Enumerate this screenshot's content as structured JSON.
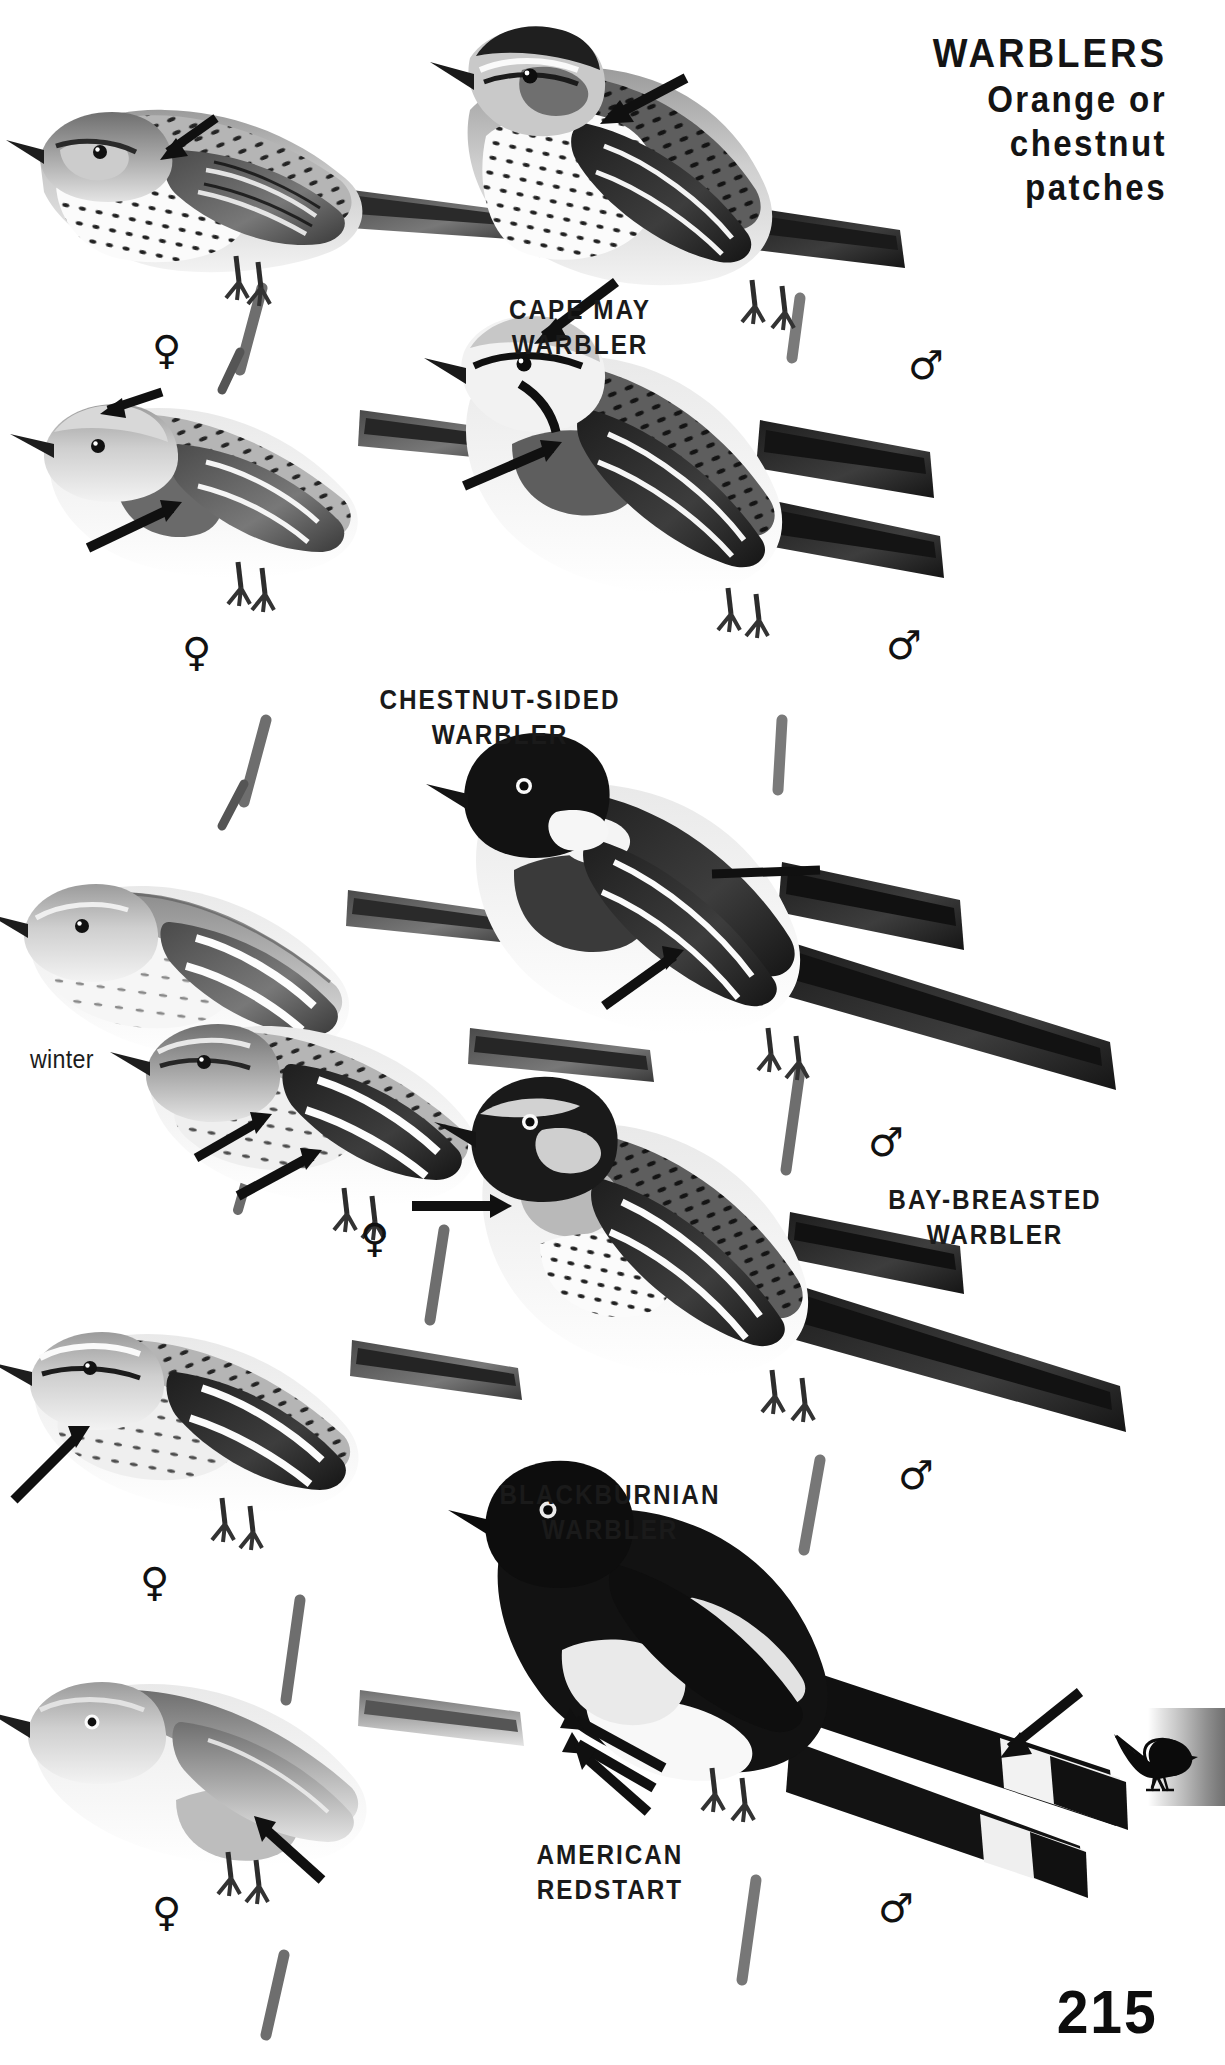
{
  "page": {
    "number": "215",
    "background_color": "#ffffff",
    "ink_color": "#141414"
  },
  "header": {
    "line1": "WARBLERS",
    "line2": "Orange or",
    "line3": "chestnut",
    "line4": "patches"
  },
  "species": [
    {
      "id": "cape-may-warbler",
      "label_line1": "CAPE MAY",
      "label_line2": "WARBLER",
      "female_symbol": "♀",
      "male_symbol": "♂"
    },
    {
      "id": "chestnut-sided-warbler",
      "label_line1": "CHESTNUT-SIDED",
      "label_line2": "WARBLER",
      "female_symbol": "♀",
      "male_symbol": "♂"
    },
    {
      "id": "bay-breasted-warbler",
      "label_line1": "BAY-BREASTED",
      "label_line2": "WARBLER",
      "female_symbol": "♀",
      "male_symbol": "♂",
      "plumage_note": "winter"
    },
    {
      "id": "blackburnian-warbler",
      "label_line1": "BLACKBURNIAN",
      "label_line2": "WARBLER",
      "female_symbol": "♀",
      "male_symbol": "♂"
    },
    {
      "id": "american-redstart",
      "label_line1": "AMERICAN",
      "label_line2": "REDSTART",
      "female_symbol": "♀",
      "male_symbol": "♂"
    }
  ],
  "notes": {
    "winter": "winter"
  },
  "thumb_tab": {
    "icon": "warbler-silhouette-icon",
    "gradient_from": "#ffffff",
    "gradient_to": "#707070"
  }
}
